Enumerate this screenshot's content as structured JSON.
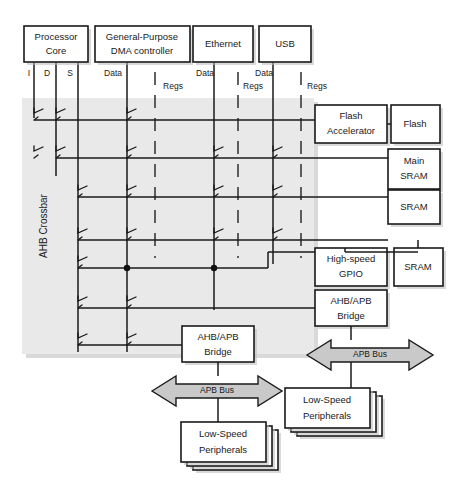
{
  "diagram": {
    "crossbar_label": "AHB Crossbar",
    "masters": [
      {
        "id": "processor-core",
        "label_line1": "Processor",
        "label_line2": "Core",
        "ports": [
          "I",
          "D",
          "S"
        ]
      },
      {
        "id": "gpdma",
        "label_line1": "General-Purpose",
        "label_line2": "DMA controller",
        "ports": [
          "Data",
          "Regs"
        ]
      },
      {
        "id": "ethernet",
        "label_line1": "Ethernet",
        "label_line2": "",
        "ports": [
          "Data",
          "Regs"
        ]
      },
      {
        "id": "usb",
        "label_line1": "USB",
        "label_line2": "",
        "ports": [
          "Data",
          "Regs"
        ]
      }
    ],
    "slaves": [
      {
        "id": "flash-accelerator",
        "label_line1": "Flash",
        "label_line2": "Accelerator"
      },
      {
        "id": "flash",
        "label_line1": "Flash",
        "label_line2": ""
      },
      {
        "id": "main-sram",
        "label_line1": "Main",
        "label_line2": "SRAM"
      },
      {
        "id": "sram",
        "label_line1": "SRAM",
        "label_line2": ""
      },
      {
        "id": "high-speed-gpio",
        "label_line1": "High-speed",
        "label_line2": "GPIO"
      },
      {
        "id": "gpio-sram",
        "label_line1": "SRAM",
        "label_line2": ""
      },
      {
        "id": "ahb-apb-bridge-right",
        "label_line1": "AHB/APB",
        "label_line2": "Bridge"
      },
      {
        "id": "ahb-apb-bridge-left",
        "label_line1": "AHB/APB",
        "label_line2": "Bridge"
      }
    ],
    "buses": [
      {
        "id": "apb-bus-right",
        "label": "APB Bus"
      },
      {
        "id": "apb-bus-left",
        "label": "APB Bus"
      }
    ],
    "peripherals": [
      {
        "id": "low-speed-peripherals-right",
        "label_line1": "Low-Speed",
        "label_line2": "Peripherals"
      },
      {
        "id": "low-speed-peripherals-left",
        "label_line1": "Low-Speed",
        "label_line2": "Peripherals"
      }
    ],
    "colors": {
      "line": "#1a1a1a",
      "crossbar_fill": "#e9e9e9",
      "arrow_fill": "#c9c9c9",
      "box_fill": "#ffffff",
      "shadow": "#b9b9b9"
    }
  }
}
